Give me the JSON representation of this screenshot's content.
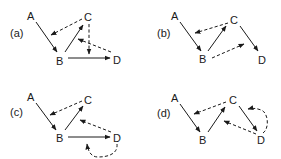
{
  "figure": {
    "colors": {
      "ink": "#1a1a1a",
      "background": "#ffffff"
    },
    "panels": [
      {
        "label": "(a)",
        "nodes": {
          "A": "A",
          "B": "B",
          "C": "C",
          "D": "D"
        },
        "solid_edges": [
          [
            "A",
            "B"
          ],
          [
            "B",
            "C"
          ],
          [
            "B",
            "D"
          ]
        ],
        "dashed_edges": [
          [
            "C",
            "B"
          ],
          [
            "C",
            "D"
          ],
          [
            "D",
            "C"
          ]
        ]
      },
      {
        "label": "(b)",
        "nodes": {
          "A": "A",
          "B": "B",
          "C": "C",
          "D": "D"
        },
        "solid_edges": [
          [
            "A",
            "B"
          ],
          [
            "B",
            "C"
          ],
          [
            "C",
            "D"
          ]
        ],
        "dashed_edges": [
          [
            "C",
            "B"
          ],
          [
            "B",
            "D"
          ]
        ]
      },
      {
        "label": "(c)",
        "nodes": {
          "A": "A",
          "B": "B",
          "C": "C",
          "D": "D"
        },
        "solid_edges": [
          [
            "A",
            "B"
          ],
          [
            "B",
            "C"
          ],
          [
            "B",
            "D"
          ]
        ],
        "dashed_edges": [
          [
            "C",
            "B"
          ],
          [
            "D",
            "C"
          ],
          [
            "D",
            "D-loop"
          ]
        ]
      },
      {
        "label": "(d)",
        "nodes": {
          "A": "A",
          "B": "B",
          "C": "C",
          "D": "D"
        },
        "solid_edges": [
          [
            "A",
            "B"
          ],
          [
            "B",
            "C"
          ],
          [
            "C",
            "D"
          ]
        ],
        "dashed_edges": [
          [
            "C",
            "B"
          ],
          [
            "D",
            "B"
          ],
          [
            "D",
            "C-loop"
          ]
        ]
      }
    ]
  }
}
